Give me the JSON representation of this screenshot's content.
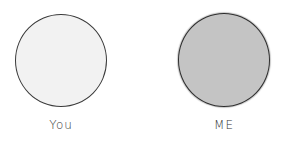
{
  "figures": [
    {
      "label": "You",
      "fill": "#f2f2f2"
    },
    {
      "label": "ME",
      "fill": "#c4c4c4"
    }
  ]
}
